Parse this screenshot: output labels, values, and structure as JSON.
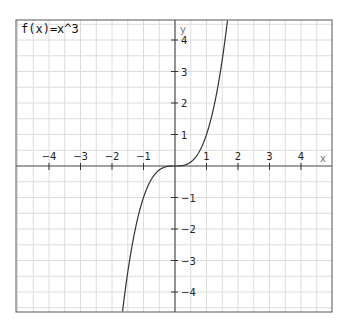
{
  "chart_data": {
    "type": "line",
    "title": "f(x)=x^3",
    "function": "x^3",
    "xlabel": "x",
    "ylabel": "y",
    "xlim": [
      -5,
      5
    ],
    "ylim": [
      -5,
      5
    ],
    "grid": true,
    "grid_step": 0.5,
    "x_ticks": [
      -4,
      -3,
      -2,
      -1,
      1,
      2,
      3,
      4
    ],
    "y_ticks": [
      -4,
      -3,
      -2,
      -1,
      1,
      2,
      3,
      4
    ],
    "x_tick_labels": [
      "−4",
      "−3",
      "−2",
      "−1",
      "1",
      "2",
      "3",
      "4"
    ],
    "y_tick_labels": [
      "−4",
      "−3",
      "−2",
      "−1",
      "1",
      "2",
      "3",
      "4"
    ],
    "series": [
      {
        "name": "f(x)=x^3",
        "color": "#333333"
      }
    ]
  },
  "colors": {
    "grid": "#dcdcdc",
    "axis": "#555555",
    "frame": "#555555",
    "curve": "#333333"
  }
}
